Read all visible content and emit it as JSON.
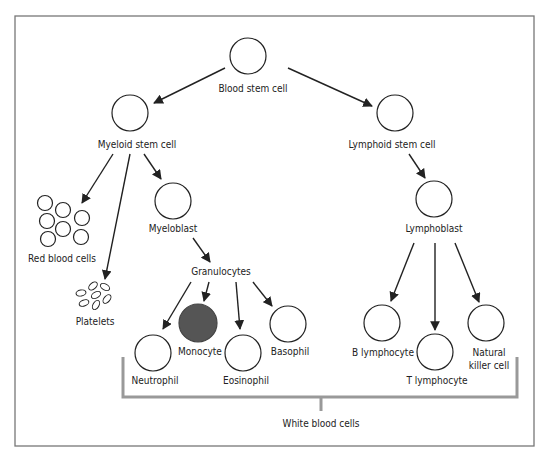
{
  "diagram": {
    "nodes": {
      "blood_stem_cell": "Blood stem cell",
      "myeloid_stem_cell": "Myeloid stem cell",
      "lymphoid_stem_cell": "Lymphoid stem cell",
      "red_blood_cells": "Red blood cells",
      "platelets": "Platelets",
      "myeloblast": "Myeloblast",
      "granulocytes": "Granulocytes",
      "neutrophil": "Neutrophil",
      "monocyte": "Monocyte",
      "eosinophil": "Eosinophil",
      "basophil": "Basophil",
      "lymphoblast": "Lymphoblast",
      "b_lymphocyte": "B lymphocyte",
      "t_lymphocyte": "T lymphocyte",
      "natural_killer_cell_line1": "Natural",
      "natural_killer_cell_line2": "killer cell",
      "white_blood_cells": "White blood cells"
    },
    "colors": {
      "line": "#222222",
      "bracket": "#999999",
      "monocyte_fill": "#555555",
      "frame": "#777777"
    }
  }
}
